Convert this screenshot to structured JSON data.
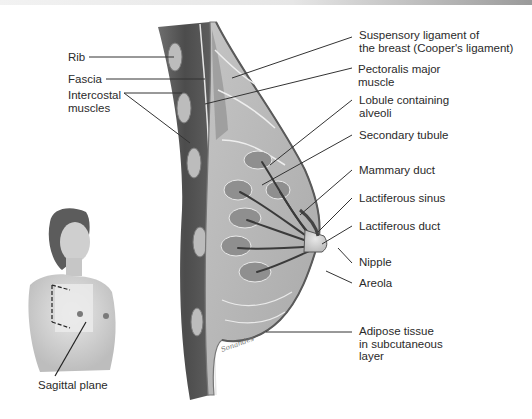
{
  "figure": {
    "type": "anatomical-illustration",
    "left_labels": [
      {
        "id": "rib",
        "lines": [
          "Rib"
        ]
      },
      {
        "id": "fascia",
        "lines": [
          "Fascia"
        ]
      },
      {
        "id": "intercostal-muscles",
        "lines": [
          "Intercostal",
          "muscles"
        ]
      }
    ],
    "right_labels": [
      {
        "id": "suspensory-ligament",
        "lines": [
          "Suspensory ligament of",
          "the breast (Cooper's ligament)"
        ]
      },
      {
        "id": "pectoralis-major",
        "lines": [
          "Pectoralis major",
          "muscle"
        ]
      },
      {
        "id": "lobule",
        "lines": [
          "Lobule containing",
          "alveoli"
        ]
      },
      {
        "id": "secondary-tubule",
        "lines": [
          "Secondary tubule"
        ]
      },
      {
        "id": "mammary-duct",
        "lines": [
          "Mammary duct"
        ]
      },
      {
        "id": "lactiferous-sinus",
        "lines": [
          "Lactiferous sinus"
        ]
      },
      {
        "id": "lactiferous-duct",
        "lines": [
          "Lactiferous duct"
        ]
      },
      {
        "id": "nipple",
        "lines": [
          "Nipple"
        ]
      },
      {
        "id": "areola",
        "lines": [
          "Areola"
        ]
      },
      {
        "id": "adipose-tissue",
        "lines": [
          "Adipose tissue",
          "in subcutaneous",
          "layer"
        ]
      }
    ],
    "inset": {
      "description": "Female torso with dashed sagittal plane indicator",
      "label": "Sagittal plane"
    },
    "artist_signature": "Sonandes"
  },
  "colors": {
    "background": "#ffffff",
    "label_text": "#2a2a2a",
    "leader_line": "#333333",
    "muscle": "#5a5a5a",
    "gland": "#9a9a9a",
    "fat": "#c8c8c8",
    "skin": "#d8d8d8"
  }
}
